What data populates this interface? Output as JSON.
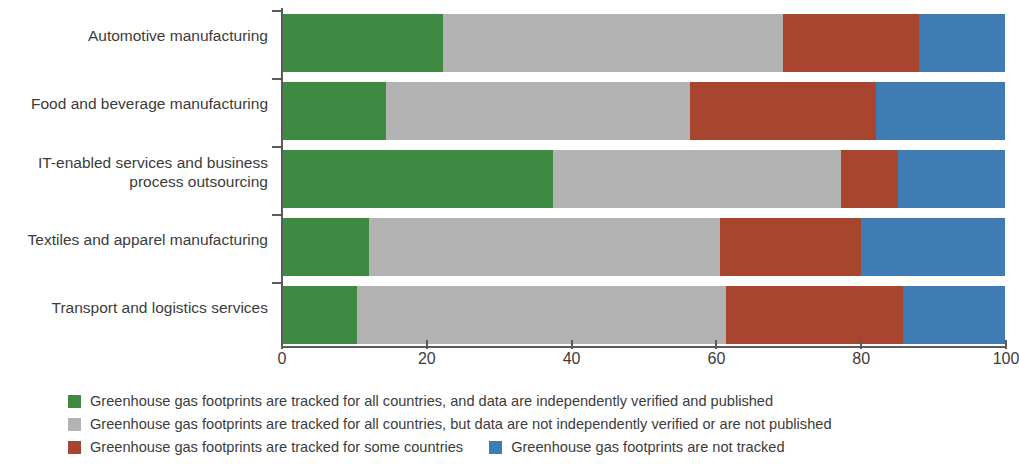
{
  "chart_data": {
    "type": "bar",
    "orientation": "horizontal",
    "stacked": true,
    "normalized": true,
    "title": "",
    "subtitle": "",
    "xlabel": "",
    "ylabel": "",
    "xlim": [
      0,
      100
    ],
    "xticks": [
      0,
      20,
      40,
      60,
      80,
      100
    ],
    "xtick_labels": [
      "0",
      "20",
      "40",
      "60",
      "80",
      "100"
    ],
    "grid": false,
    "legend_position": "bottom",
    "categories": [
      "Automotive manufacturing",
      "Food and beverage manufacturing",
      "IT-enabled services and business process outsourcing",
      "Textiles and apparel manufacturing",
      "Transport and logistics services"
    ],
    "category_lines": [
      [
        "Automotive manufacturing"
      ],
      [
        "Food and beverage manufacturing"
      ],
      [
        "IT-enabled services and business",
        "process outsourcing"
      ],
      [
        "Textiles and apparel manufacturing"
      ],
      [
        "Transport and logistics services"
      ]
    ],
    "series": [
      {
        "name": "Greenhouse gas footprints are tracked for all countries, and data are independently verified and published",
        "short_name": "tracked-all-verified-published",
        "color": "#3f8a43",
        "values": [
          22.2,
          14.2,
          37.4,
          11.9,
          10.2
        ]
      },
      {
        "name": "Greenhouse gas footprints are tracked for all countries, but data are not independently verified or are not published",
        "short_name": "tracked-all-not-verified",
        "color": "#b3b3b3",
        "values": [
          47.1,
          42.2,
          39.9,
          48.6,
          51.1
        ]
      },
      {
        "name": "Greenhouse gas footprints are tracked for some countries",
        "short_name": "tracked-some-countries",
        "color": "#a8452f",
        "values": [
          18.8,
          25.8,
          7.9,
          19.6,
          24.6
        ]
      },
      {
        "name": "Greenhouse gas footprints are not tracked",
        "short_name": "not-tracked",
        "color": "#3f7cb4",
        "values": [
          11.9,
          17.8,
          14.8,
          19.9,
          14.1
        ]
      }
    ]
  },
  "legend": {
    "lines": [
      [
        {
          "color": "#3f8a43",
          "label": "Greenhouse gas footprints are tracked for all countries, and data are independently verified and published"
        }
      ],
      [
        {
          "color": "#b3b3b3",
          "label": "Greenhouse gas footprints are tracked for all countries, but data are not independently verified or are not published"
        }
      ],
      [
        {
          "color": "#a8452f",
          "label": "Greenhouse gas footprints are tracked for some countries"
        },
        {
          "color": "#3f7cb4",
          "label": "Greenhouse gas footprints are not tracked"
        }
      ]
    ]
  },
  "axis": {
    "color": "#5b5b5b"
  }
}
